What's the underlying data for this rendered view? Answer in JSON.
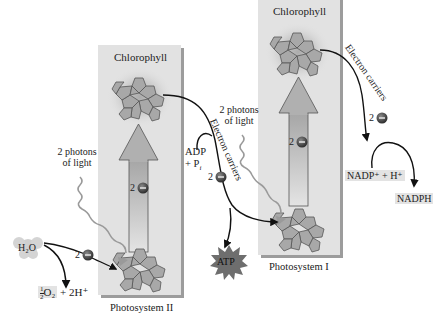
{
  "diagram": {
    "title": "",
    "photosystem_ii": {
      "label": "Photosystem II",
      "chlorophyll_label": "Chlorophyll",
      "electron_label": "2e⁻"
    },
    "photosystem_i": {
      "label": "Photosystem I",
      "chlorophyll_label": "Chlorophyll",
      "electron_label": "2e⁻"
    },
    "inputs": {
      "water": "H₂O",
      "water_products_frac_num": "1",
      "water_products_frac_den": "2",
      "water_products_o2": "O₂",
      "water_products_rest": "+ 2H⁺",
      "water_electrons": "2e⁻",
      "photons_psii_line1": "2 photons",
      "photons_psii_line2": "of light",
      "photons_psi_line1": "2 photons",
      "photons_psi_line2": "of light",
      "adp_line1": "ADP",
      "adp_line2": "+ P",
      "adp_subscript": "i"
    },
    "carriers": {
      "between_label": "Electron carriers",
      "between_electrons": "2e⁻",
      "after_psi_label": "Electron carriers",
      "after_psi_electrons": "2e⁻"
    },
    "outputs": {
      "atp": "ATP",
      "nadp_input": "NADP⁺ + H⁺",
      "nadph": "NADPH"
    },
    "colors": {
      "panel_fill": "#e2e2e2",
      "panel_shadow": "#9c9c9c",
      "molecule_fill": "#a8a8a8",
      "molecule_stroke": "#555555",
      "arrow_fill": "#b5b5b5",
      "atp_fill": "#6e6e6e",
      "electron_fill": "#3a3a3a",
      "highlight_bg": "#e3e3e3"
    }
  }
}
